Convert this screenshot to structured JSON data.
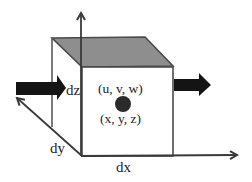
{
  "diagram": {
    "labels": {
      "dz": "dz",
      "dy": "dy",
      "dx": "dx",
      "velocity": "(u, v, w)",
      "position": "(x, y, z)"
    },
    "elements": {
      "cube": "rectangular control volume element with shaded top face",
      "inflow_arrow": "thick black arrow entering left face",
      "outflow_arrow": "thick black arrow leaving right face",
      "center_point": "dark dot at cube center",
      "axes": [
        "x-axis (right)",
        "y-axis (diagonal, up-left)",
        "z-axis (up)"
      ]
    },
    "colors": {
      "top_face": "#8e8e8e",
      "edges": "#555555",
      "arrows": "#141414",
      "center_dot": "#2a2a2a",
      "background": "#ffffff"
    }
  }
}
